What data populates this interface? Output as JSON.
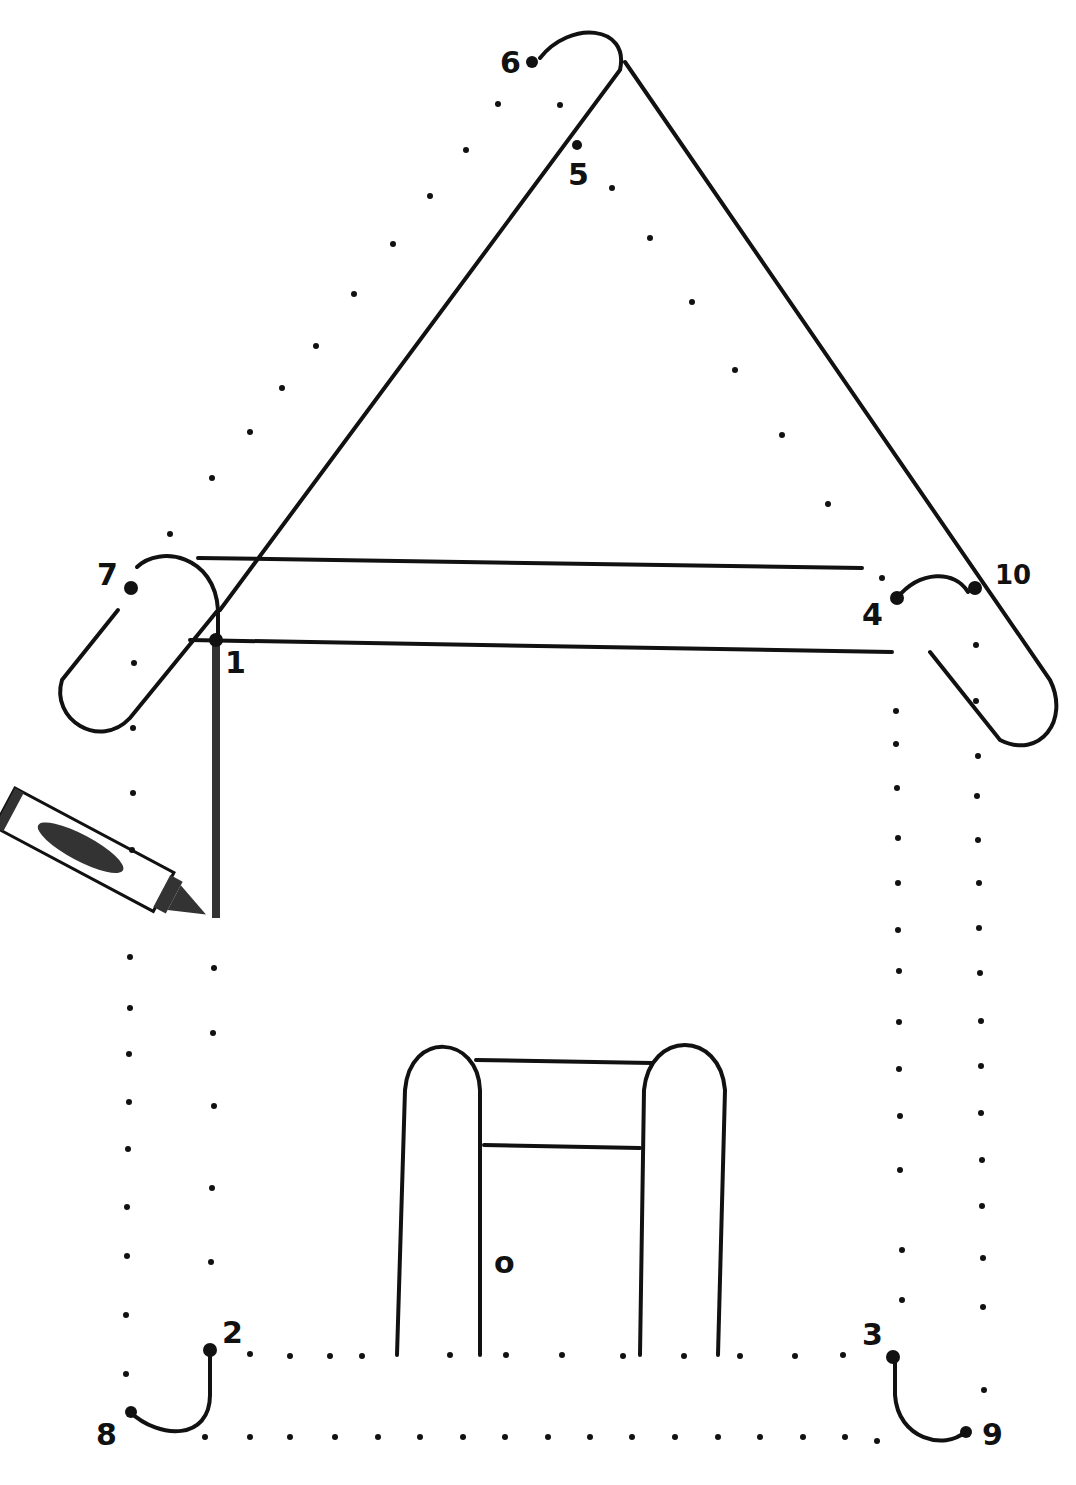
{
  "worksheet": {
    "title": "Connect the dots house",
    "ink_color": "#111111",
    "background": "#ffffff",
    "labels": [
      {
        "id": "n6",
        "text": "6",
        "x": 500,
        "y": 48
      },
      {
        "id": "n5",
        "text": "5",
        "x": 568,
        "y": 160
      },
      {
        "id": "n7",
        "text": "7",
        "x": 97,
        "y": 560
      },
      {
        "id": "n1",
        "text": "1",
        "x": 225,
        "y": 648
      },
      {
        "id": "n4",
        "text": "4",
        "x": 862,
        "y": 600
      },
      {
        "id": "n10",
        "text": "10",
        "x": 995,
        "y": 562
      },
      {
        "id": "n2",
        "text": "2",
        "x": 222,
        "y": 1318
      },
      {
        "id": "n8",
        "text": "8",
        "x": 96,
        "y": 1420
      },
      {
        "id": "n3",
        "text": "3",
        "x": 862,
        "y": 1320
      },
      {
        "id": "n9",
        "text": "9",
        "x": 982,
        "y": 1420
      },
      {
        "id": "knob",
        "text": "o",
        "x": 494,
        "y": 1248
      }
    ]
  }
}
